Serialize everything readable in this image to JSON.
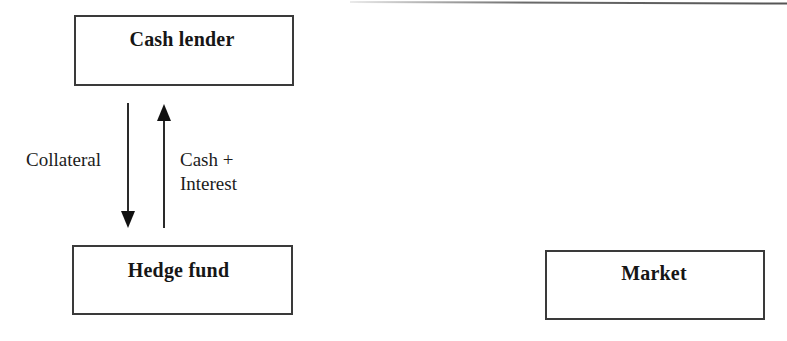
{
  "diagram": {
    "type": "flow diagram",
    "nodes": [
      {
        "id": "cash_lender",
        "label": "Cash lender"
      },
      {
        "id": "hedge_fund",
        "label": "Hedge fund"
      },
      {
        "id": "market",
        "label": "Market"
      }
    ],
    "edges": [
      {
        "from": "hedge_fund",
        "to": "cash_lender",
        "label": "Collateral",
        "direction": "down-arrow-to-hedge-fund"
      },
      {
        "from": "cash_lender",
        "to": "hedge_fund",
        "label": "Cash + Interest",
        "direction": "up-arrow-to-cash-lender"
      }
    ],
    "labels": {
      "cash_lender": "Cash lender",
      "hedge_fund": "Hedge fund",
      "market": "Market",
      "collateral": "Collateral",
      "cash_line1": "Cash +",
      "cash_line2": "Interest"
    },
    "colors": {
      "stroke": "#3a3a3a",
      "text": "#161616",
      "background": "#ffffff"
    }
  }
}
